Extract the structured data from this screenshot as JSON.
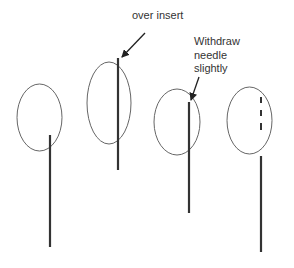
{
  "diagram": {
    "colors": {
      "background": "#ffffff",
      "ellipse_stroke": "#666666",
      "needle": "#333333",
      "text": "#333333",
      "arrow": "#222222"
    },
    "stages": [
      {
        "id": 1,
        "ellipse": {
          "cx": 39.5,
          "cy": 117.5,
          "rx": 22.5,
          "ry": 33.5
        },
        "needle": {
          "x": 50,
          "y1": 135,
          "y2": 247,
          "style": "solid"
        }
      },
      {
        "id": 2,
        "ellipse": {
          "cx": 109,
          "cy": 103,
          "rx": 22,
          "ry": 41
        },
        "needle": {
          "x": 118,
          "y1": 58,
          "y2": 170,
          "style": "solid"
        },
        "annotation": {
          "text": "over insert",
          "arrow": {
            "x1": 145,
            "y1": 33,
            "x2": 122,
            "y2": 57
          }
        }
      },
      {
        "id": 3,
        "ellipse": {
          "cx": 177,
          "cy": 122,
          "rx": 23,
          "ry": 33
        },
        "needle": {
          "x": 189,
          "y1": 102,
          "y2": 213,
          "style": "solid"
        },
        "annotation": {
          "lines": [
            "Withdraw",
            "needle",
            "slightly"
          ],
          "arrow": {
            "x1": 199,
            "y1": 77,
            "x2": 191,
            "y2": 100
          }
        }
      },
      {
        "id": 4,
        "ellipse": {
          "cx": 249.5,
          "cy": 120.5,
          "rx": 22.5,
          "ry": 33.5
        },
        "needle": {
          "x": 261,
          "y1": 156,
          "y2": 252,
          "style": "solid"
        },
        "dashed_segment": {
          "x": 261,
          "dashes": [
            [
              97,
              103
            ],
            [
              110,
              116
            ],
            [
              123,
              130
            ]
          ]
        }
      }
    ]
  },
  "labels": {
    "over_insert": "over insert",
    "withdraw_line1": "Withdraw",
    "withdraw_line2": "needle",
    "withdraw_line3": "slightly"
  }
}
